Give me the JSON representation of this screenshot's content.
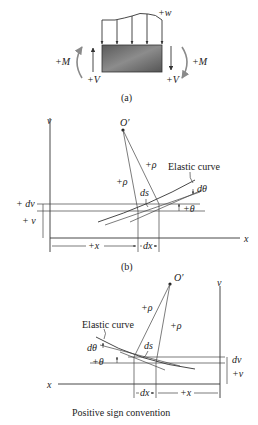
{
  "figure_a": {
    "caption": "(a)",
    "load_label": "+w",
    "moment_left_label": "+M",
    "moment_right_label": "+M",
    "shear_left_label": "+V",
    "shear_right_label": "+V",
    "colors": {
      "beam_fill": "#6f6f6f",
      "arrow": "#333333",
      "moment_arrow": "#8a8a8a"
    }
  },
  "figure_b": {
    "caption": "(b)",
    "axis_v_label": "v",
    "axis_x_label": "x",
    "center_label": "O′",
    "rho_left_label": "+ρ",
    "rho_right_label": "+ρ",
    "curve_label": "Elastic curve",
    "dtheta_label": "dθ",
    "theta_label": "+θ",
    "ds_label": "ds",
    "dv_label": "+ dv",
    "v_label": "+ v",
    "x_dim_label": "+x",
    "dx_dim_label": "dx"
  },
  "figure_c": {
    "caption": "Positive sign convention",
    "axis_v_label": "v",
    "axis_x_label": "x",
    "center_label": "O′",
    "rho_left_label": "+ρ",
    "rho_right_label": "+ρ",
    "curve_label": "Elastic curve",
    "dtheta_label": "dθ",
    "theta_label": "+θ",
    "ds_label": "ds",
    "dv_label": "dv",
    "v_label": "+v",
    "x_dim_label": "+x",
    "dx_dim_label": "dx"
  }
}
